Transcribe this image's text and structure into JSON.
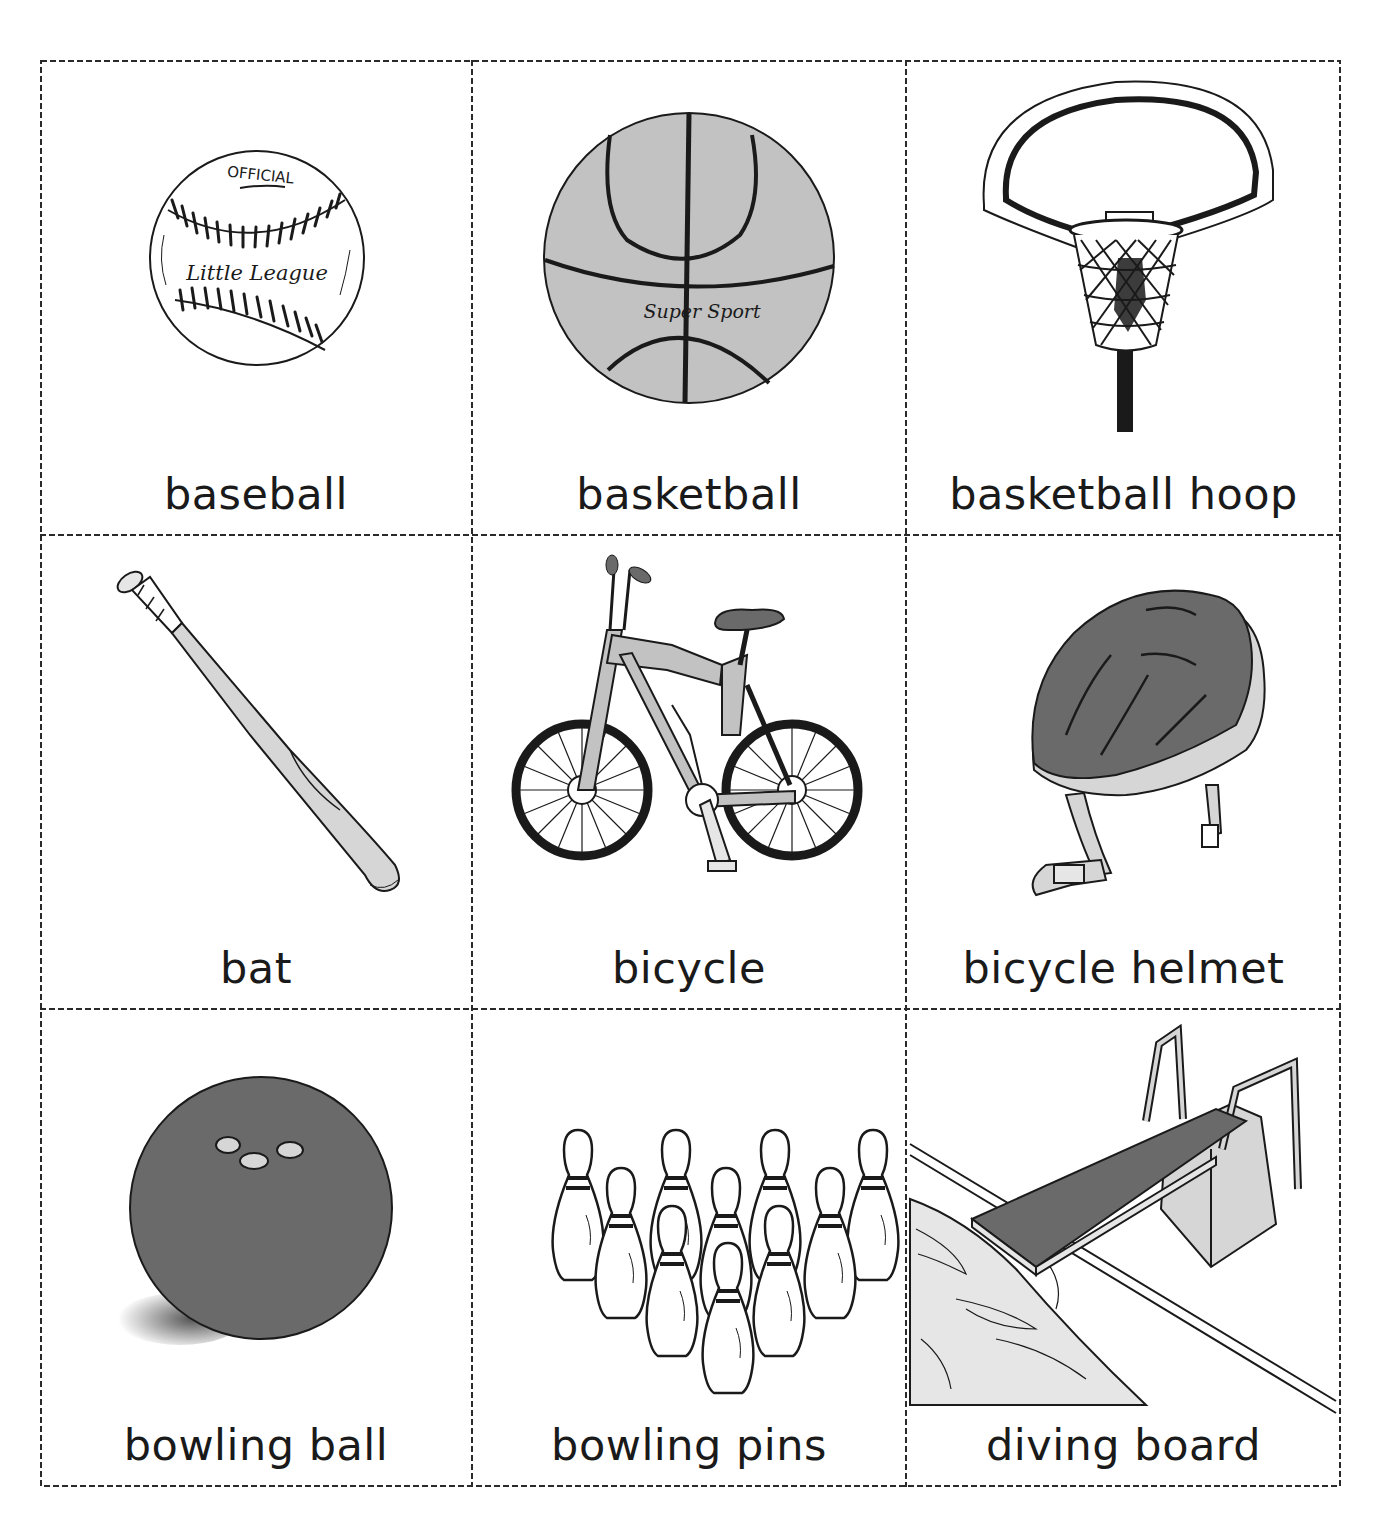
{
  "sheet": {
    "title": "Sports vocabulary picture cards",
    "cards": [
      {
        "label": "baseball",
        "image_text": [
          "OFFICIAL",
          "Little League"
        ],
        "icon": "baseball-icon"
      },
      {
        "label": "basketball",
        "image_text": [
          "Super Sport"
        ],
        "icon": "basketball-icon"
      },
      {
        "label": "basketball hoop",
        "icon": "basketball-hoop-icon"
      },
      {
        "label": "bat",
        "icon": "baseball-bat-icon"
      },
      {
        "label": "bicycle",
        "icon": "bicycle-icon"
      },
      {
        "label": "bicycle helmet",
        "icon": "bicycle-helmet-icon"
      },
      {
        "label": "bowling ball",
        "icon": "bowling-ball-icon"
      },
      {
        "label": "bowling pins",
        "icon": "bowling-pins-icon"
      },
      {
        "label": "diving board",
        "icon": "diving-board-icon"
      }
    ]
  },
  "colors": {
    "ink": "#1a1a1a",
    "basketball_fill": "#c2c2c2",
    "dark_gray": "#6a6a6a",
    "light_gray": "#d6d6d6",
    "pale_gray": "#e6e6e6"
  }
}
